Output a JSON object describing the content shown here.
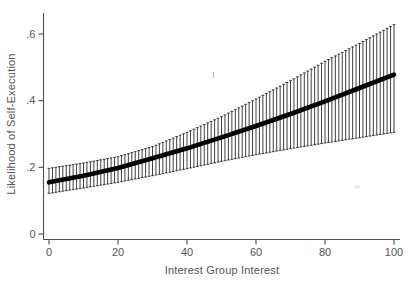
{
  "chart_data": {
    "type": "line",
    "title": "",
    "xlabel": "Interest Group Interest",
    "ylabel": "Likelihood of Self-Execution",
    "xlim": [
      0,
      100
    ],
    "ylim": [
      0,
      0.66
    ],
    "grid": false,
    "legend": null,
    "xticks": {
      "values": [
        0,
        20,
        40,
        60,
        80,
        100
      ],
      "labels": [
        "0",
        "20",
        "40",
        "60",
        "80",
        "100"
      ]
    },
    "yticks": {
      "values": [
        0,
        0.2,
        0.4,
        0.6
      ],
      "labels": [
        "0",
        ".2",
        ".4",
        ".6"
      ]
    },
    "axis_color": "#4d4d4d",
    "label_color": "#555555",
    "series": [
      {
        "name": "Predicted likelihood of self-execution",
        "type": "line",
        "color": "#000000",
        "x": [
          0,
          10,
          20,
          30,
          40,
          50,
          60,
          70,
          80,
          90,
          100
        ],
        "y": [
          0.155,
          0.175,
          0.198,
          0.227,
          0.257,
          0.29,
          0.324,
          0.36,
          0.398,
          0.438,
          0.478
        ]
      },
      {
        "name": "Confidence interval (capped error bars at each unit of x)",
        "type": "errorbar",
        "color": "#1f1f1f",
        "x_step": 1,
        "x": [
          0,
          10,
          20,
          30,
          40,
          50,
          60,
          70,
          80,
          90,
          100
        ],
        "lower": [
          0.122,
          0.138,
          0.155,
          0.175,
          0.196,
          0.218,
          0.238,
          0.256,
          0.273,
          0.289,
          0.305
        ],
        "upper": [
          0.197,
          0.213,
          0.232,
          0.262,
          0.305,
          0.352,
          0.405,
          0.46,
          0.518,
          0.572,
          0.628
        ]
      }
    ]
  }
}
